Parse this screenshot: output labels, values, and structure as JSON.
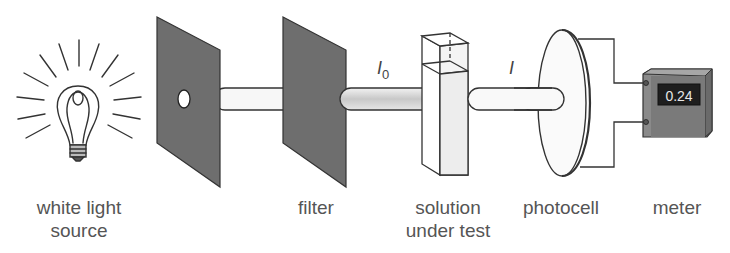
{
  "labels": {
    "source_line1": "white light",
    "source_line2": "source",
    "filter": "filter",
    "solution_line1": "solution",
    "solution_line2": "under test",
    "photocell": "photocell",
    "meter": "meter"
  },
  "symbols": {
    "incident_intensity": "I",
    "incident_subscript": "0",
    "transmitted_intensity": "I"
  },
  "meter": {
    "reading": "0.24"
  },
  "colors": {
    "plate": "#6e6e6e",
    "meter_body": "#7a7a7a",
    "display": "#1e1e1e",
    "beam_filtered": "#d4d4d4",
    "outline": "#333333"
  }
}
